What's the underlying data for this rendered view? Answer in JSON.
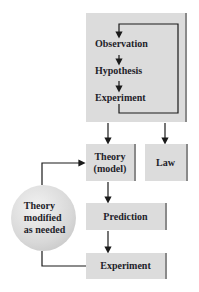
{
  "diagram": {
    "title": "",
    "top_box": {
      "steps": [
        "Observation",
        "Hypothesis",
        "Experiment"
      ]
    },
    "theory_box": {
      "line1": "Theory",
      "line2": "(model)"
    },
    "law_box": {
      "label": "Law"
    },
    "prediction_box": {
      "label": "Prediction"
    },
    "experiment_box": {
      "label": "Experiment"
    },
    "feedback_circle": {
      "line1": "Theory",
      "line2": "modified",
      "line3": "as needed"
    },
    "colors": {
      "box_fill": "#dcdcdc",
      "box_edge": "#8a8a8a",
      "text": "#1e1e2a",
      "arrow": "#1a1a1a"
    }
  }
}
